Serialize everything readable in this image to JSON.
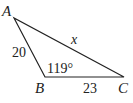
{
  "diagram": {
    "type": "triangle",
    "vertices": {
      "A": {
        "label": "A",
        "x": 14,
        "y": 18
      },
      "B": {
        "label": "B",
        "x": 45,
        "y": 77
      },
      "C": {
        "label": "C",
        "x": 124,
        "y": 77
      }
    },
    "sides": {
      "AB": {
        "label": "20"
      },
      "BC": {
        "label": "23"
      },
      "AC": {
        "label": "x"
      }
    },
    "angles": {
      "B": {
        "label": "119°"
      }
    },
    "colors": {
      "stroke": "#222222",
      "background": "#ffffff"
    }
  }
}
